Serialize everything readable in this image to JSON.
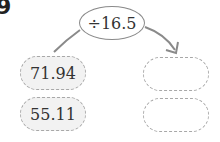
{
  "problem": {
    "number": "9",
    "operation": "÷16.5",
    "inputs": [
      "71.94",
      "55.11"
    ],
    "outputs": [
      "",
      ""
    ]
  },
  "colors": {
    "line": "#8a8a8a",
    "dashed_border": "#a8a8a8",
    "input_fill": "#f2f2f2"
  }
}
